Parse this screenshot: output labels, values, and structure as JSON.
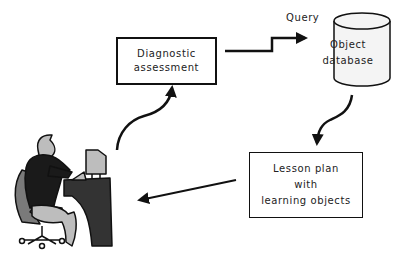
{
  "diagram": {
    "nodes": {
      "diagnostic": {
        "line1": "Diagnostic",
        "line2": "assessment"
      },
      "database": {
        "line1": "Object",
        "line2": "database"
      },
      "lesson_plan": {
        "line1": "Lesson plan",
        "line2": "with",
        "line3": "learning objects"
      },
      "learner": {
        "icon": "person-at-computer-icon"
      }
    },
    "edges": {
      "query_label": "Query"
    },
    "colors": {
      "stroke": "#111111",
      "desk": "#333333",
      "body": "#1a1a1a",
      "light_gray": "#bdbdbd",
      "mid_gray": "#7a7a7a",
      "db_fill": "#f4f4f4"
    }
  }
}
